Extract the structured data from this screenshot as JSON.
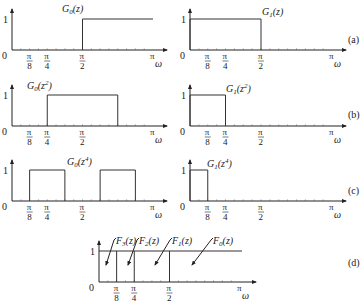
{
  "figure": {
    "panels": [
      {
        "id": "a",
        "tag": "(a)",
        "plots": [
          {
            "label": "G0(z)",
            "label_main": "G",
            "label_sub": "0",
            "label_arg": "(z)",
            "label_sup": "",
            "bands": [
              [
                0.5,
                1.0
              ]
            ]
          },
          {
            "label": "G1(z)",
            "label_main": "G",
            "label_sub": "1",
            "label_arg": "(z)",
            "label_sup": "",
            "bands": [
              [
                0.0,
                0.5
              ]
            ]
          }
        ]
      },
      {
        "id": "b",
        "tag": "(b)",
        "plots": [
          {
            "label": "G0(z^2)",
            "label_main": "G",
            "label_sub": "0",
            "label_arg": "(z",
            "label_sup": "2",
            "bands": [
              [
                0.25,
                0.75
              ]
            ]
          },
          {
            "label": "G1(z^2)",
            "label_main": "G",
            "label_sub": "1",
            "label_arg": "(z",
            "label_sup": "2",
            "bands": [
              [
                0.0,
                0.25
              ]
            ]
          }
        ]
      },
      {
        "id": "c",
        "tag": "(c)",
        "plots": [
          {
            "label": "G0(z^4)",
            "label_main": "G",
            "label_sub": "0",
            "label_arg": "(z",
            "label_sup": "4",
            "bands": [
              [
                0.125,
                0.375
              ],
              [
                0.625,
                0.875
              ]
            ]
          },
          {
            "label": "G1(z^4)",
            "label_main": "G",
            "label_sub": "1",
            "label_arg": "(z",
            "label_sup": "4",
            "bands": [
              [
                0.0,
                0.125
              ]
            ]
          }
        ]
      },
      {
        "id": "d",
        "tag": "(d)",
        "plots": [
          {
            "label": "F3,F2,F1,F0",
            "dividers": [
              0.125,
              0.25,
              0.5
            ],
            "level": 1,
            "filters": [
              {
                "name": "F3(z)",
                "main": "F",
                "sub": "3",
                "arg": "(z)"
              },
              {
                "name": "F2(z)",
                "main": "F",
                "sub": "2",
                "arg": "(z)"
              },
              {
                "name": "F1(z)",
                "main": "F",
                "sub": "1",
                "arg": "(z)"
              },
              {
                "name": "F0(z)",
                "main": "F",
                "sub": "0",
                "arg": "(z)"
              }
            ]
          }
        ]
      }
    ],
    "axis": {
      "y_tick": "1",
      "origin": "0",
      "x_label": "ω",
      "x_ticks": [
        {
          "frac": 0.125,
          "num": "π",
          "den": "8"
        },
        {
          "frac": 0.25,
          "num": "π",
          "den": "4"
        },
        {
          "frac": 0.5,
          "num": "π",
          "den": "2"
        },
        {
          "frac": 1.0,
          "num": "π",
          "den": ""
        }
      ]
    }
  },
  "chart_data": {
    "type": "line",
    "xlabel": "ω",
    "ylabel": "",
    "xlim": [
      0,
      "π"
    ],
    "ylim": [
      0,
      1
    ],
    "x_tick_labels": [
      "0",
      "π/8",
      "π/4",
      "π/2",
      "π"
    ],
    "y_tick_labels": [
      "1"
    ],
    "grid": false,
    "series": [
      {
        "panel": "a",
        "name": "G0(z)",
        "passband": [
          [
            "π/2",
            "π"
          ]
        ],
        "gain": 1
      },
      {
        "panel": "a",
        "name": "G1(z)",
        "passband": [
          [
            "0",
            "π/2"
          ]
        ],
        "gain": 1
      },
      {
        "panel": "b",
        "name": "G0(z^2)",
        "passband": [
          [
            "π/4",
            "3π/4"
          ]
        ],
        "gain": 1
      },
      {
        "panel": "b",
        "name": "G1(z^2)",
        "passband": [
          [
            "0",
            "π/4"
          ]
        ],
        "gain": 1
      },
      {
        "panel": "c",
        "name": "G0(z^4)",
        "passband": [
          [
            "π/8",
            "3π/8"
          ],
          [
            "5π/8",
            "7π/8"
          ]
        ],
        "gain": 1
      },
      {
        "panel": "c",
        "name": "G1(z^4)",
        "passband": [
          [
            "0",
            "π/8"
          ]
        ],
        "gain": 1
      },
      {
        "panel": "d",
        "name": "F3(z)",
        "passband": [
          [
            "0",
            "π/8"
          ]
        ],
        "gain": 1
      },
      {
        "panel": "d",
        "name": "F2(z)",
        "passband": [
          [
            "π/8",
            "π/4"
          ]
        ],
        "gain": 1
      },
      {
        "panel": "d",
        "name": "F1(z)",
        "passband": [
          [
            "π/4",
            "π/2"
          ]
        ],
        "gain": 1
      },
      {
        "panel": "d",
        "name": "F0(z)",
        "passband": [
          [
            "π/2",
            "π"
          ]
        ],
        "gain": 1
      }
    ],
    "annotations": [
      "(a)",
      "(b)",
      "(c)",
      "(d)"
    ]
  }
}
